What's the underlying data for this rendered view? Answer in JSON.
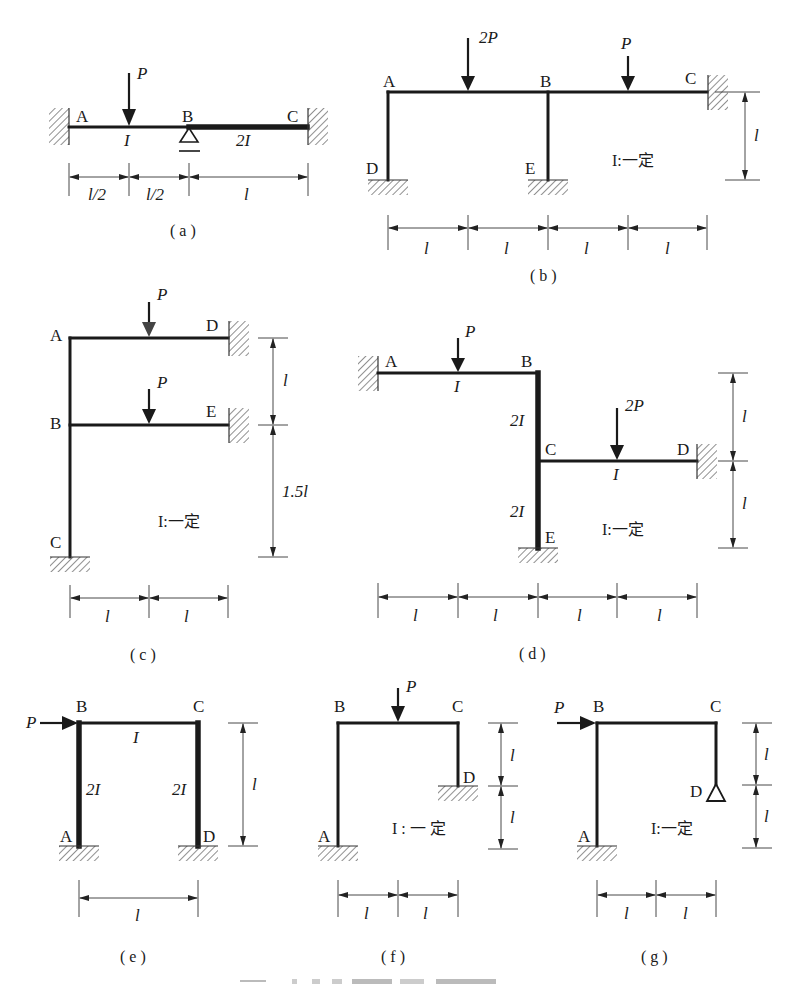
{
  "figure": {
    "caption_visible": false,
    "accent_color": "#1a1a1a",
    "subfigures": [
      {
        "id": "a",
        "label": "( a )",
        "nodes": [
          "A",
          "B",
          "C"
        ],
        "loads": [
          {
            "name": "P",
            "direction": "down"
          }
        ],
        "member_props": [
          "I",
          "2I"
        ],
        "supports": {
          "A": "fixed",
          "B": "roller",
          "C": "fixed"
        },
        "dimensions": [
          "l/2",
          "l/2",
          "l"
        ]
      },
      {
        "id": "b",
        "label": "( b )",
        "nodes": [
          "A",
          "B",
          "C",
          "D",
          "E"
        ],
        "loads": [
          {
            "name": "2P",
            "direction": "down"
          },
          {
            "name": "P",
            "direction": "down"
          }
        ],
        "note": "I:一定",
        "supports": {
          "C": "fixed",
          "D": "fixed",
          "E": "fixed"
        },
        "dimensions": [
          "l",
          "l",
          "l",
          "l"
        ],
        "height_dimension": "l"
      },
      {
        "id": "c",
        "label": "( c )",
        "nodes": [
          "A",
          "B",
          "C",
          "D",
          "E"
        ],
        "loads": [
          {
            "name": "P",
            "direction": "down"
          },
          {
            "name": "P",
            "direction": "down"
          }
        ],
        "note": "I:一定",
        "supports": {
          "C": "fixed",
          "D": "fixed",
          "E": "fixed"
        },
        "dimensions": [
          "l",
          "l"
        ],
        "height_dimensions": [
          "l",
          "1.5l"
        ]
      },
      {
        "id": "d",
        "label": "( d )",
        "nodes": [
          "A",
          "B",
          "C",
          "D",
          "E"
        ],
        "loads": [
          {
            "name": "P",
            "direction": "down"
          },
          {
            "name": "2P",
            "direction": "down"
          }
        ],
        "member_props": [
          "I",
          "2I",
          "2I",
          "I"
        ],
        "note": "I:一定",
        "supports": {
          "A": "fixed",
          "D": "fixed",
          "E": "fixed"
        },
        "dimensions": [
          "l",
          "l",
          "l",
          "l"
        ],
        "height_dimensions": [
          "l",
          "l"
        ]
      },
      {
        "id": "e",
        "label": "( e )",
        "nodes": [
          "A",
          "B",
          "C",
          "D"
        ],
        "loads": [
          {
            "name": "P",
            "direction": "right"
          }
        ],
        "member_props": [
          "I",
          "2I",
          "2I"
        ],
        "supports": {
          "A": "fixed",
          "D": "fixed"
        },
        "dimensions": [
          "l"
        ],
        "height_dimension": "l"
      },
      {
        "id": "f",
        "label": "( f )",
        "nodes": [
          "A",
          "B",
          "C",
          "D"
        ],
        "loads": [
          {
            "name": "P",
            "direction": "down"
          }
        ],
        "note": "I : 一 定",
        "supports": {
          "A": "fixed",
          "D": "fixed"
        },
        "dimensions": [
          "l",
          "l"
        ],
        "height_dimensions": [
          "l",
          "l"
        ]
      },
      {
        "id": "g",
        "label": "( g )",
        "nodes": [
          "A",
          "B",
          "C",
          "D"
        ],
        "loads": [
          {
            "name": "P",
            "direction": "right"
          }
        ],
        "note": "I:一定",
        "supports": {
          "A": "fixed",
          "D": "pin"
        },
        "dimensions": [
          "l",
          "l"
        ],
        "height_dimensions": [
          "l",
          "l"
        ]
      }
    ]
  }
}
